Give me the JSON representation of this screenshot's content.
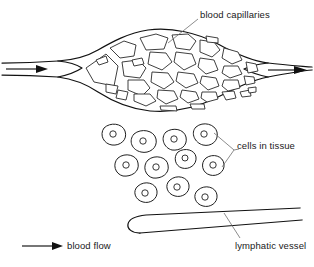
{
  "figure": {
    "title_partial": "",
    "background_color": "#ffffff",
    "ink_color": "#1a1a1a",
    "leader_color": "#6f6f6f",
    "width": 314,
    "height": 267
  },
  "labels": {
    "blood_capillaries": "blood capillaries",
    "cells_in_tissue": "cells in tissue",
    "lymphatic_vessel": "lymphatic vessel",
    "blood_flow": "blood flow"
  },
  "legend": {
    "items": [
      {
        "symbol": "arrow-right",
        "label": "blood flow"
      }
    ]
  },
  "diagram": {
    "type": "capillary-bed-anatomy",
    "structures": [
      {
        "name": "arteriole-inflow",
        "label": "blood flow",
        "direction": "right",
        "side": "left"
      },
      {
        "name": "capillary-bed",
        "label": "blood capillaries",
        "shape": "lens",
        "cell_count": 34
      },
      {
        "name": "venule-outflow",
        "label": "blood flow",
        "direction": "right",
        "side": "right"
      },
      {
        "name": "tissue-cells",
        "label": "cells in tissue",
        "cell_count": 12,
        "has_nuclei": true
      },
      {
        "name": "lymphatic-vessel",
        "label": "lymphatic vessel",
        "end": "blind-ended",
        "direction": "widens-right"
      }
    ]
  }
}
